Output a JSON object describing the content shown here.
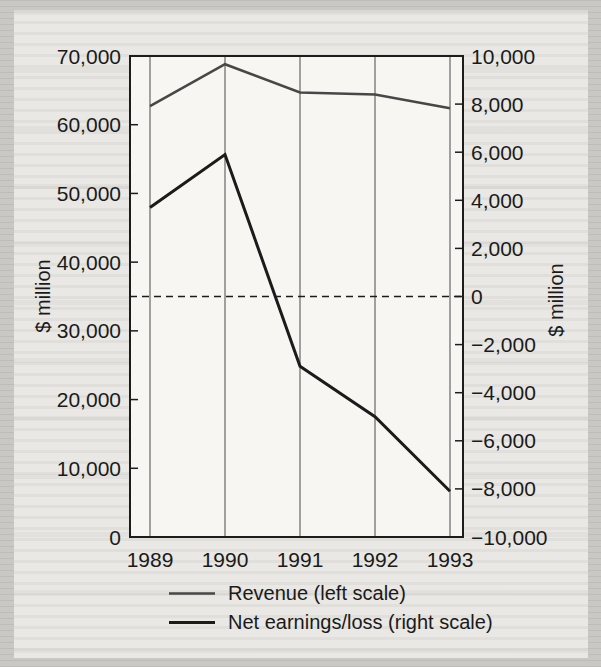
{
  "chart_data": {
    "type": "line",
    "title": "",
    "x": [
      1989,
      1990,
      1991,
      1992,
      1993
    ],
    "x_tick_labels": [
      "1989",
      "1990",
      "1991",
      "1992",
      "1993"
    ],
    "series": [
      {
        "name": "Revenue (left scale)",
        "axis": "left",
        "values": [
          62700,
          68800,
          64700,
          64400,
          62400
        ],
        "color": "#474747",
        "width": 2.5
      },
      {
        "name": "Net earnings/loss (right scale)",
        "axis": "right",
        "values": [
          3700,
          5900,
          -2900,
          -5000,
          -8100
        ],
        "color": "#1b1b1b",
        "width": 3
      }
    ],
    "left_axis": {
      "title": "$ million",
      "min": 0,
      "max": 70000,
      "tick_step": 10000,
      "ticks": [
        {
          "value": 0,
          "label": "0"
        },
        {
          "value": 10000,
          "label": "10,000"
        },
        {
          "value": 20000,
          "label": "20,000"
        },
        {
          "value": 30000,
          "label": "30,000"
        },
        {
          "value": 40000,
          "label": "40,000"
        },
        {
          "value": 50000,
          "label": "50,000"
        },
        {
          "value": 60000,
          "label": "60,000"
        },
        {
          "value": 70000,
          "label": "70,000"
        }
      ]
    },
    "right_axis": {
      "title": "$ million",
      "min": -10000,
      "max": 10000,
      "tick_step": 2000,
      "ticks": [
        {
          "value": -10000,
          "label": "−10,000"
        },
        {
          "value": -8000,
          "label": "−8,000"
        },
        {
          "value": -6000,
          "label": "−6,000"
        },
        {
          "value": -4000,
          "label": "−4,000"
        },
        {
          "value": -2000,
          "label": "−2,000"
        },
        {
          "value": 0,
          "label": "0"
        },
        {
          "value": 2000,
          "label": "2,000"
        },
        {
          "value": 4000,
          "label": "4,000"
        },
        {
          "value": 6000,
          "label": "6,000"
        },
        {
          "value": 8000,
          "label": "8,000"
        },
        {
          "value": 10000,
          "label": "10,000"
        }
      ]
    },
    "zero_line": {
      "axis": "right",
      "value": 0,
      "style": "dashed"
    },
    "grid": {
      "vertical_gridlines_at_years": true,
      "horizontal_gridlines": false
    },
    "legend_position": "bottom"
  },
  "colors": {
    "ink": "#1c1c1c",
    "gridline": "#4b4b4b",
    "plot_background": "#f7f6f2",
    "page_background": "#e9e8e4"
  }
}
